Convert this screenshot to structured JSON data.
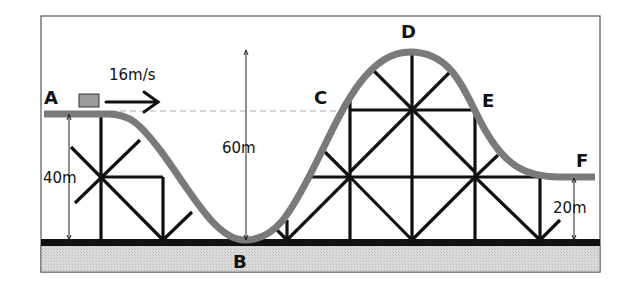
{
  "diagram": {
    "points": [
      {
        "id": "A",
        "label": "A"
      },
      {
        "id": "B",
        "label": "B"
      },
      {
        "id": "C",
        "label": "C"
      },
      {
        "id": "D",
        "label": "D"
      },
      {
        "id": "E",
        "label": "E"
      },
      {
        "id": "F",
        "label": "F"
      }
    ],
    "velocity": {
      "label": "16m/s"
    },
    "heights": {
      "A": "40m",
      "D": "60m",
      "F": "20m"
    },
    "colors": {
      "track": "#7a7a7a",
      "structure": "#111111",
      "ground_fill": "#d6d6d6",
      "cart": "#9c9c9c",
      "frame": "#555555"
    }
  }
}
